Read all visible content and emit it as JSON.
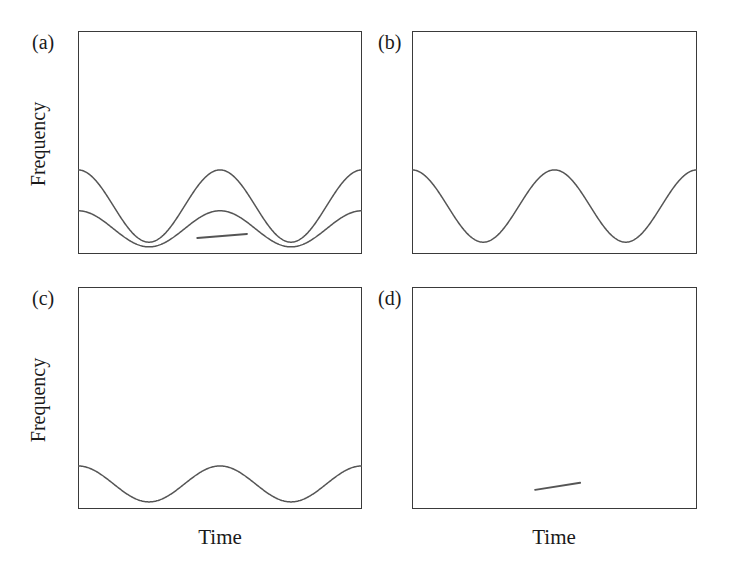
{
  "figure": {
    "background_color": "#ffffff",
    "axis_color": "#3a3a3a",
    "curve_color": "#555555",
    "text_color": "#1a1a1a"
  },
  "labels": {
    "panel_a": "(a)",
    "panel_b": "(b)",
    "panel_c": "(c)",
    "panel_d": "(d)",
    "y_axis_top": "Frequency",
    "y_axis_bottom": "Frequency",
    "x_axis_left": "Time",
    "x_axis_right": "Time"
  },
  "chart_data": [
    {
      "type": "line",
      "title": "(a)",
      "xlabel": "Time",
      "ylabel": "Frequency",
      "xlim": [
        0,
        1
      ],
      "ylim": [
        0,
        1
      ],
      "grid": false,
      "legend": "none",
      "axis_ticks": "none",
      "series": [
        {
          "name": "high-amplitude oscillation",
          "shape": "cosine",
          "cycles": 2,
          "phase_deg": 0,
          "baseline": 0.215,
          "amplitude": 0.162,
          "color": "#555555",
          "values": [
            0.377,
            0.36,
            0.312,
            0.243,
            0.17,
            0.108,
            0.068,
            0.056,
            0.073,
            0.117,
            0.181,
            0.254,
            0.323,
            0.368,
            0.377,
            0.35,
            0.292,
            0.217,
            0.145,
            0.09,
            0.061,
            0.062,
            0.092,
            0.148,
            0.219,
            0.294,
            0.353,
            0.377
          ]
        },
        {
          "name": "low-amplitude oscillation",
          "shape": "cosine",
          "cycles": 2,
          "phase_deg": 0,
          "baseline": 0.113,
          "amplitude": 0.081,
          "color": "#555555",
          "values": [
            0.194,
            0.185,
            0.161,
            0.127,
            0.09,
            0.059,
            0.039,
            0.033,
            0.042,
            0.064,
            0.096,
            0.132,
            0.167,
            0.19,
            0.194,
            0.181,
            0.152,
            0.114,
            0.078,
            0.051,
            0.036,
            0.037,
            0.052,
            0.08,
            0.116,
            0.153,
            0.182,
            0.194
          ]
        },
        {
          "name": "short trend segment",
          "shape": "segment",
          "x_range": [
            0.42,
            0.595
          ],
          "y_range": [
            0.072,
            0.09
          ],
          "color": "#555555"
        }
      ]
    },
    {
      "type": "line",
      "title": "(b)",
      "xlabel": "Time",
      "ylabel": "",
      "xlim": [
        0,
        1
      ],
      "ylim": [
        0,
        1
      ],
      "grid": false,
      "legend": "none",
      "axis_ticks": "none",
      "series": [
        {
          "name": "high-amplitude oscillation",
          "shape": "cosine",
          "cycles": 2,
          "phase_deg": 0,
          "baseline": 0.215,
          "amplitude": 0.162,
          "color": "#555555",
          "values": [
            0.377,
            0.36,
            0.312,
            0.243,
            0.17,
            0.108,
            0.068,
            0.056,
            0.073,
            0.117,
            0.181,
            0.254,
            0.323,
            0.368,
            0.377,
            0.35,
            0.292,
            0.217,
            0.145,
            0.09,
            0.061,
            0.062,
            0.092,
            0.148,
            0.219,
            0.294,
            0.353,
            0.377
          ]
        }
      ]
    },
    {
      "type": "line",
      "title": "(c)",
      "xlabel": "Time",
      "ylabel": "Frequency",
      "xlim": [
        0,
        1
      ],
      "ylim": [
        0,
        1
      ],
      "grid": false,
      "legend": "none",
      "axis_ticks": "none",
      "series": [
        {
          "name": "low-amplitude oscillation",
          "shape": "cosine",
          "cycles": 2,
          "phase_deg": 0,
          "baseline": 0.113,
          "amplitude": 0.081,
          "color": "#555555",
          "values": [
            0.194,
            0.185,
            0.161,
            0.127,
            0.09,
            0.059,
            0.039,
            0.033,
            0.042,
            0.064,
            0.096,
            0.132,
            0.167,
            0.19,
            0.194,
            0.181,
            0.152,
            0.114,
            0.078,
            0.051,
            0.036,
            0.037,
            0.052,
            0.08,
            0.116,
            0.153,
            0.182,
            0.194
          ]
        }
      ]
    },
    {
      "type": "line",
      "title": "(d)",
      "xlabel": "Time",
      "ylabel": "",
      "xlim": [
        0,
        1
      ],
      "ylim": [
        0,
        1
      ],
      "grid": false,
      "legend": "none",
      "axis_ticks": "none",
      "series": [
        {
          "name": "short trend segment",
          "shape": "segment",
          "x_range": [
            0.432,
            0.59
          ],
          "y_range": [
            0.086,
            0.118
          ],
          "color": "#555555"
        }
      ]
    }
  ]
}
